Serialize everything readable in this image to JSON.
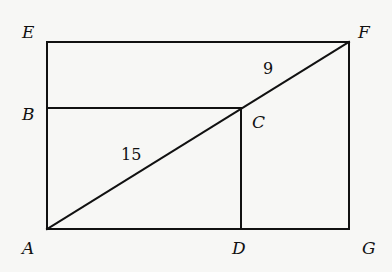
{
  "diagram": {
    "points": {
      "A": {
        "label": "A",
        "x": 47,
        "y": 229
      },
      "B": {
        "label": "B",
        "x": 47,
        "y": 108
      },
      "C": {
        "label": "C",
        "x": 241,
        "y": 108
      },
      "D": {
        "label": "D",
        "x": 241,
        "y": 229
      },
      "E": {
        "label": "E",
        "x": 47,
        "y": 42
      },
      "F": {
        "label": "F",
        "x": 349,
        "y": 42
      },
      "G": {
        "label": "G",
        "x": 349,
        "y": 229
      }
    },
    "segments": [
      [
        "A",
        "E"
      ],
      [
        "E",
        "F"
      ],
      [
        "F",
        "G"
      ],
      [
        "G",
        "A"
      ],
      [
        "B",
        "C"
      ],
      [
        "C",
        "D"
      ],
      [
        "A",
        "F"
      ]
    ],
    "measures": {
      "AC": "15",
      "CF": "9"
    },
    "line_color": "#111111"
  }
}
